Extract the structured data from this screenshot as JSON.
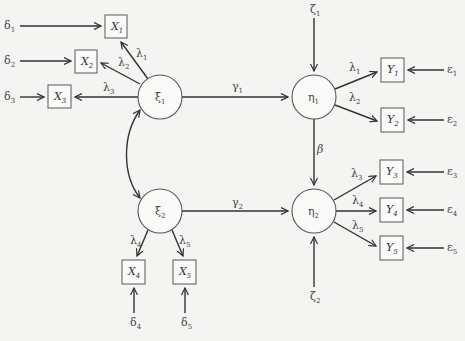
{
  "diagram": {
    "type": "structural-equation-model",
    "latent_exogenous": [
      {
        "id": "xi1",
        "symbol": "ξ",
        "sub": "1",
        "cx": 160,
        "cy": 97,
        "r": 22
      },
      {
        "id": "xi2",
        "symbol": "ξ",
        "sub": "2",
        "cx": 160,
        "cy": 211,
        "r": 22
      }
    ],
    "latent_endogenous": [
      {
        "id": "eta1",
        "symbol": "η",
        "sub": "1",
        "cx": 314,
        "cy": 97,
        "r": 22
      },
      {
        "id": "eta2",
        "symbol": "η",
        "sub": "2",
        "cx": 314,
        "cy": 211,
        "r": 22
      }
    ],
    "observed_x": [
      {
        "id": "X1",
        "symbol": "X",
        "sub": "1",
        "x": 105,
        "y": 15,
        "w": 22,
        "h": 23
      },
      {
        "id": "X2",
        "symbol": "X",
        "sub": "2",
        "x": 75,
        "y": 50,
        "w": 22,
        "h": 23
      },
      {
        "id": "X3",
        "symbol": "X",
        "sub": "3",
        "x": 48,
        "y": 85,
        "w": 23,
        "h": 23
      },
      {
        "id": "X4",
        "symbol": "X",
        "sub": "4",
        "x": 122,
        "y": 260,
        "w": 23,
        "h": 24
      },
      {
        "id": "X5",
        "symbol": "X",
        "sub": "5",
        "x": 173,
        "y": 260,
        "w": 23,
        "h": 24
      }
    ],
    "observed_y": [
      {
        "id": "Y1",
        "symbol": "Y",
        "sub": "1",
        "x": 381,
        "y": 58,
        "w": 23,
        "h": 24
      },
      {
        "id": "Y2",
        "symbol": "Y",
        "sub": "2",
        "x": 381,
        "y": 108,
        "w": 23,
        "h": 24
      },
      {
        "id": "Y3",
        "symbol": "Y",
        "sub": "3",
        "x": 380,
        "y": 160,
        "w": 23,
        "h": 24
      },
      {
        "id": "Y4",
        "symbol": "Y",
        "sub": "4",
        "x": 380,
        "y": 198,
        "w": 23,
        "h": 24
      },
      {
        "id": "Y5",
        "symbol": "Y",
        "sub": "5",
        "x": 380,
        "y": 236,
        "w": 23,
        "h": 24
      }
    ],
    "error_terms_x": [
      {
        "symbol": "δ",
        "sub": "1",
        "x": 4,
        "y": 29
      },
      {
        "symbol": "δ",
        "sub": "2",
        "x": 4,
        "y": 64
      },
      {
        "symbol": "δ",
        "sub": "3",
        "x": 4,
        "y": 100
      },
      {
        "symbol": "δ",
        "sub": "4",
        "x": 130,
        "y": 326
      },
      {
        "symbol": "δ",
        "sub": "5",
        "x": 181,
        "y": 326
      }
    ],
    "error_terms_y": [
      {
        "symbol": "ε",
        "sub": "1",
        "x": 447,
        "y": 73
      },
      {
        "symbol": "ε",
        "sub": "2",
        "x": 447,
        "y": 123
      },
      {
        "symbol": "ε",
        "sub": "3",
        "x": 447,
        "y": 175
      },
      {
        "symbol": "ε",
        "sub": "4",
        "x": 447,
        "y": 213
      },
      {
        "symbol": "ε",
        "sub": "5",
        "x": 447,
        "y": 251
      }
    ],
    "disturbances": [
      {
        "symbol": "ζ",
        "sub": "1",
        "x": 310,
        "y": 13
      },
      {
        "symbol": "ζ",
        "sub": "2",
        "x": 310,
        "y": 300
      }
    ],
    "path_labels": [
      {
        "symbol": "λ",
        "sub": "1",
        "x": 136,
        "y": 57
      },
      {
        "symbol": "λ",
        "sub": "2",
        "x": 118,
        "y": 66
      },
      {
        "symbol": "λ",
        "sub": "3",
        "x": 103,
        "y": 91
      },
      {
        "symbol": "γ",
        "sub": "1",
        "x": 232,
        "y": 90
      },
      {
        "symbol": "γ",
        "sub": "2",
        "x": 232,
        "y": 206
      },
      {
        "symbol": "β",
        "sub": "",
        "x": 317,
        "y": 153
      },
      {
        "symbol": "λ",
        "sub": "1",
        "x": 349,
        "y": 71
      },
      {
        "symbol": "λ",
        "sub": "2",
        "x": 349,
        "y": 101
      },
      {
        "symbol": "λ",
        "sub": "3",
        "x": 351,
        "y": 177
      },
      {
        "symbol": "λ",
        "sub": "4",
        "x": 352,
        "y": 204
      },
      {
        "symbol": "λ",
        "sub": "5",
        "x": 352,
        "y": 229
      },
      {
        "symbol": "λ",
        "sub": "4",
        "x": 130,
        "y": 244
      },
      {
        "symbol": "λ",
        "sub": "5",
        "x": 179,
        "y": 244
      }
    ]
  }
}
